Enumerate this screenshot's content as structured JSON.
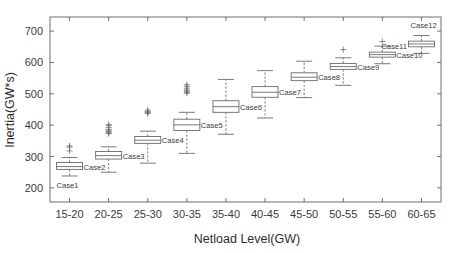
{
  "chart_data": {
    "type": "box",
    "title": "",
    "xlabel": "Netload Level(GW)",
    "ylabel": "Inertia(GW*s)",
    "categories": [
      "15-20",
      "20-25",
      "25-30",
      "30-35",
      "35-40",
      "40-45",
      "45-50",
      "50-55",
      "55-60",
      "60-65"
    ],
    "xtick_labels": [
      "15-20",
      "20-25",
      "25-30",
      "30-35",
      "35-40",
      "40-45",
      "45-50",
      "50-55",
      "55-60",
      "60-65"
    ],
    "ytick_labels": [
      "200",
      "300",
      "400",
      "500",
      "600",
      "700"
    ],
    "ytick_values": [
      200,
      300,
      400,
      500,
      600,
      700
    ],
    "ylim": [
      155,
      745
    ],
    "grid": false,
    "legend": null,
    "boxes": [
      {
        "category": "15-20",
        "whisker_low": 238,
        "q1": 259,
        "median": 268,
        "q3": 281,
        "whisker_high": 297,
        "outliers": [
          318,
          330,
          334
        ]
      },
      {
        "category": "20-25",
        "whisker_low": 250,
        "q1": 292,
        "median": 303,
        "q3": 316,
        "whisker_high": 331,
        "outliers": [
          373,
          376,
          379,
          382,
          386,
          392,
          398,
          402
        ]
      },
      {
        "category": "25-30",
        "whisker_low": 279,
        "q1": 342,
        "median": 352,
        "q3": 364,
        "whisker_high": 381,
        "outliers": [
          437,
          440,
          444,
          448
        ]
      },
      {
        "category": "30-35",
        "whisker_low": 310,
        "q1": 383,
        "median": 401,
        "q3": 419,
        "whisker_high": 441,
        "outliers": [
          502,
          505,
          509,
          512,
          518,
          524,
          529
        ]
      },
      {
        "category": "35-40",
        "whisker_low": 371,
        "q1": 441,
        "median": 459,
        "q3": 478,
        "whisker_high": 546,
        "outliers": []
      },
      {
        "category": "40-45",
        "whisker_low": 423,
        "q1": 489,
        "median": 505,
        "q3": 523,
        "whisker_high": 574,
        "outliers": []
      },
      {
        "category": "45-50",
        "whisker_low": 488,
        "q1": 542,
        "median": 553,
        "q3": 567,
        "whisker_high": 604,
        "outliers": []
      },
      {
        "category": "50-55",
        "whisker_low": 527,
        "q1": 578,
        "median": 587,
        "q3": 597,
        "whisker_high": 615,
        "outliers": [
          641
        ]
      },
      {
        "category": "55-60",
        "whisker_low": 596,
        "q1": 617,
        "median": 625,
        "q3": 633,
        "whisker_high": 652,
        "outliers": [
          667
        ]
      },
      {
        "category": "60-65",
        "whisker_low": 629,
        "q1": 650,
        "median": 659,
        "q3": 668,
        "whisker_high": 686,
        "outliers": []
      }
    ],
    "annotations": [
      {
        "text": "Case1",
        "category": "15-20",
        "anchor": "below"
      },
      {
        "text": "Case2",
        "category": "15-20",
        "anchor": "right"
      },
      {
        "text": "Case3",
        "category": "20-25",
        "anchor": "right"
      },
      {
        "text": "Case4",
        "category": "25-30",
        "anchor": "right"
      },
      {
        "text": "Case5",
        "category": "30-35",
        "anchor": "right"
      },
      {
        "text": "Case6",
        "category": "35-40",
        "anchor": "right"
      },
      {
        "text": "Case7",
        "category": "40-45",
        "anchor": "right"
      },
      {
        "text": "Case8",
        "category": "45-50",
        "anchor": "right"
      },
      {
        "text": "Case9",
        "category": "50-55",
        "anchor": "right"
      },
      {
        "text": "Case10",
        "category": "55-60",
        "anchor": "right"
      },
      {
        "text": "Case11",
        "category": "55-60",
        "anchor": "above-right"
      },
      {
        "text": "Case12",
        "category": "60-65",
        "anchor": "above"
      }
    ]
  },
  "colors": {
    "background": "#ffffff",
    "axis": "#6f6f6f",
    "box_stroke": "#6a6a6a",
    "box_fill": "#ffffff",
    "text": "#3a3a3a"
  }
}
